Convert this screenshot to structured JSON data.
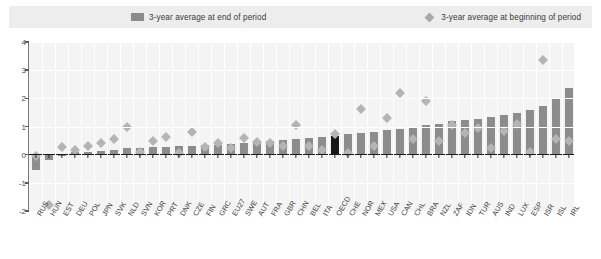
{
  "legend": {
    "series_end_label": "3-year average at end of period",
    "series_begin_label": "3-year average at beginning of period",
    "bar_color": "#8c8c8c",
    "diamond_color": "#b4b4b4",
    "highlight_color": "#181818"
  },
  "chart_data": {
    "type": "bar",
    "title": "",
    "subtitle": "",
    "xlabel": "",
    "ylabel": "",
    "ylim": [
      -2,
      4
    ],
    "yticks": [
      4,
      3,
      2,
      1,
      0,
      -1,
      -2
    ],
    "ytick_labels": [
      "4",
      "3",
      "2",
      "1",
      "0",
      "-1",
      "-2"
    ],
    "grid": true,
    "legend_position": "top",
    "highlight_category": "OECD",
    "categories": [
      "RUS",
      "HUN",
      "EST",
      "DEU",
      "POL",
      "JPN",
      "SVK",
      "NLD",
      "SVN",
      "KOR",
      "PRT",
      "DNK",
      "CZE",
      "FIN",
      "GRC",
      "EU27",
      "SWE",
      "AUT",
      "FRA",
      "GBR",
      "CHN",
      "BEL",
      "ITA",
      "OECD",
      "CHE",
      "NOR",
      "MEX",
      "USA",
      "CAN",
      "CHL",
      "BRA",
      "NZL",
      "ZAF",
      "IDN",
      "TUR",
      "AUS",
      "IND",
      "LUX",
      "ESP",
      "ISR",
      "ISL",
      "IRL"
    ],
    "series": [
      {
        "name": "3-year average at end of period",
        "type": "bar",
        "values": [
          -0.55,
          -0.2,
          -0.05,
          0.08,
          0.1,
          0.12,
          0.15,
          0.22,
          0.24,
          0.26,
          0.28,
          0.3,
          0.32,
          0.34,
          0.36,
          0.38,
          0.4,
          0.45,
          0.5,
          0.52,
          0.55,
          0.58,
          0.62,
          0.68,
          0.72,
          0.78,
          0.82,
          0.86,
          0.92,
          0.98,
          1.05,
          1.1,
          1.18,
          1.22,
          1.28,
          1.35,
          1.42,
          1.48,
          1.58,
          1.72,
          2.02,
          2.35
        ]
      },
      {
        "name": "3-year average at beginning of period",
        "type": "scatter",
        "values": [
          -0.05,
          -1.78,
          0.28,
          0.18,
          0.3,
          0.42,
          0.55,
          1.0,
          0.08,
          0.48,
          0.62,
          0.05,
          0.8,
          0.28,
          0.4,
          0.25,
          0.58,
          0.45,
          0.4,
          0.32,
          1.05,
          0.3,
          0.15,
          0.72,
          0.05,
          1.62,
          0.3,
          1.3,
          2.18,
          0.55,
          1.9,
          0.5,
          1.05,
          0.78,
          0.95,
          0.25,
          0.85,
          1.1,
          0.08,
          3.35,
          0.55,
          0.48
        ]
      }
    ]
  }
}
